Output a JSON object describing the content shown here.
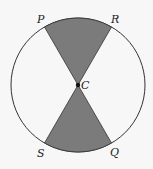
{
  "diagram": {
    "type": "circle-sectors",
    "center_label": "C",
    "points": [
      {
        "label": "P",
        "position": "top-left"
      },
      {
        "label": "R",
        "position": "top-right"
      },
      {
        "label": "S",
        "position": "bottom-left"
      },
      {
        "label": "Q",
        "position": "bottom-right"
      }
    ],
    "shaded_sectors": [
      "PCR",
      "SCQ"
    ],
    "colors": {
      "shade": "#7b7b7b",
      "stroke": "#333333",
      "background": "#f7f7f7"
    }
  }
}
